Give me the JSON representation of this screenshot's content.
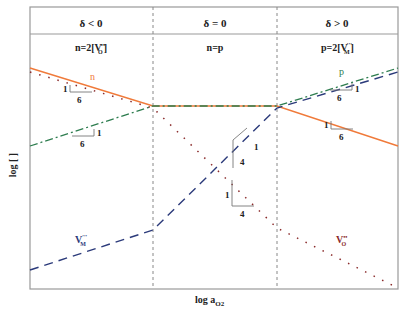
{
  "header": {
    "regions": [
      {
        "condition": "δ < 0",
        "neutrality": "n=2[V",
        "sub": "O",
        "sup": "••",
        "close": "]"
      },
      {
        "condition": "δ = 0",
        "neutrality": "n=p"
      },
      {
        "condition": "δ > 0",
        "neutrality": "p=2[V",
        "sub": "M",
        "sup": "′′′",
        "close": "]"
      }
    ]
  },
  "axes": {
    "ylabel": "log [ ]",
    "xlabel": "log a",
    "xlabel_sub": "O2"
  },
  "labels": {
    "n": "n",
    "p": "p",
    "vm": "V",
    "vm_sub": "M",
    "vm_sup": "′′′",
    "vo": "V",
    "vo_sub": "O",
    "vo_sup": "••"
  },
  "slopes": {
    "n_left": {
      "rise": "1",
      "run": "6"
    },
    "p_left": {
      "rise": "1",
      "run": "6"
    },
    "p_right": {
      "rise": "1",
      "run": "6"
    },
    "n_right": {
      "rise": "1",
      "run": "6"
    },
    "vm_mid": {
      "rise": "1",
      "run": "4"
    },
    "vo_mid": {
      "rise": "1",
      "run": "4"
    }
  },
  "colors": {
    "n": "#f07a3a",
    "p": "#2e7d4f",
    "vm": "#2b3a7a",
    "vo": "#8a2a2a",
    "frame": "#888888"
  }
}
